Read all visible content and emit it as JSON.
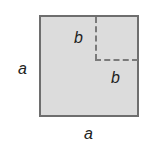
{
  "diagram": {
    "labels": {
      "inner_top": "b",
      "inner_right": "b",
      "outer_left": "a",
      "outer_bottom": "a"
    },
    "colors": {
      "fill": "#dcdcdc",
      "stroke": "#6e6e6e",
      "dash": "#7a7a7a"
    }
  }
}
